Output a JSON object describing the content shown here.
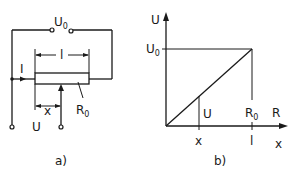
{
  "figure_a": {
    "caption": "a)",
    "labels": {
      "source_voltage": "U",
      "source_voltage_sub": "0",
      "current": "I",
      "length": "l",
      "position": "x",
      "resistance": "R",
      "resistance_sub": "0",
      "output_voltage": "U"
    }
  },
  "figure_b": {
    "caption": "b)",
    "labels": {
      "y_axis": "U",
      "u0_tick": "U",
      "u0_tick_sub": "0",
      "u_at_x": "U",
      "r0_mark": "R",
      "r0_mark_sub": "0",
      "x_axis_r": "R",
      "x_tick": "x",
      "l_tick": "l",
      "x_axis_x": "x"
    }
  },
  "colors": {
    "ink": "#1a1a1a",
    "background": "#ffffff"
  }
}
